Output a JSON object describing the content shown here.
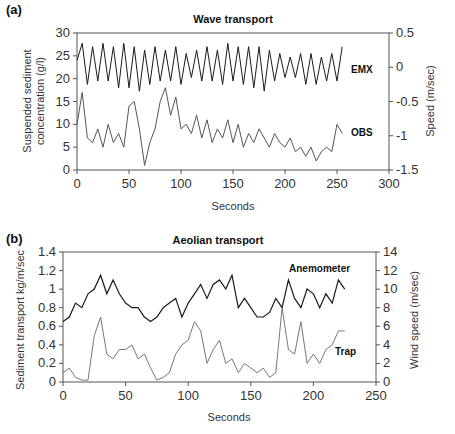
{
  "chart_data": [
    {
      "type": "line",
      "panel_label": "(a)",
      "title": "Wave transport",
      "xlabel": "Seconds",
      "ylabel": "Suspended sediment concentration (g/l)",
      "ylabel_lines": [
        "Suspended sediment",
        "concentration (g/l)"
      ],
      "y2label": "Speed (m/sec)",
      "xlim": [
        0,
        300
      ],
      "ylim": [
        0,
        30
      ],
      "y2lim": [
        -1.5,
        0.5
      ],
      "xticks": [
        0,
        50,
        100,
        150,
        200,
        250,
        300
      ],
      "yticks": [
        0,
        5,
        10,
        15,
        20,
        25,
        30
      ],
      "y2ticks": [
        "0.5",
        "0",
        "-0.5",
        "-1",
        "-1.5"
      ],
      "grid": false,
      "series": [
        {
          "name": "EMX",
          "axis": "right",
          "color": "#1a1a1a",
          "description": "Oscillating current speed roughly between -0.4 and 0.4 m/s, mean near 0",
          "x": [
            0,
            5,
            10,
            15,
            20,
            25,
            30,
            35,
            40,
            45,
            50,
            55,
            60,
            65,
            70,
            75,
            80,
            85,
            90,
            95,
            100,
            105,
            110,
            115,
            120,
            125,
            130,
            135,
            140,
            145,
            150,
            155,
            160,
            165,
            170,
            175,
            180,
            185,
            190,
            195,
            200,
            205,
            210,
            215,
            220,
            225,
            230,
            235,
            240,
            245,
            250,
            255
          ],
          "values": [
            0.1,
            0.35,
            -0.25,
            0.3,
            -0.2,
            0.35,
            -0.2,
            0.3,
            -0.3,
            0.35,
            -0.3,
            0.3,
            -0.35,
            0.25,
            -0.25,
            0.3,
            -0.2,
            0.25,
            -0.2,
            0.3,
            -0.25,
            0.2,
            -0.15,
            0.25,
            -0.2,
            0.3,
            -0.2,
            0.25,
            -0.25,
            0.35,
            -0.2,
            0.3,
            -0.25,
            0.3,
            -0.3,
            0.3,
            -0.35,
            0.25,
            -0.2,
            0.2,
            -0.15,
            0.15,
            -0.15,
            0.2,
            -0.25,
            0.2,
            -0.25,
            0.15,
            -0.2,
            0.2,
            -0.2,
            0.3
          ]
        },
        {
          "name": "OBS",
          "axis": "left",
          "color": "#555555",
          "description": "Suspended sediment concentration, mostly 3-10 g/l with bursts up to ~17-18 g/l near 50-110 s",
          "x": [
            0,
            5,
            10,
            15,
            20,
            25,
            30,
            35,
            40,
            45,
            50,
            55,
            60,
            65,
            70,
            75,
            80,
            85,
            90,
            95,
            100,
            105,
            110,
            115,
            120,
            125,
            130,
            135,
            140,
            145,
            150,
            155,
            160,
            165,
            170,
            175,
            180,
            185,
            190,
            195,
            200,
            205,
            210,
            215,
            220,
            225,
            230,
            235,
            240,
            245,
            250,
            255
          ],
          "values": [
            10,
            17,
            7,
            6,
            9,
            5,
            10,
            6,
            8,
            5,
            14,
            15,
            9,
            1,
            6,
            9,
            15,
            18,
            12,
            16,
            9,
            10,
            8,
            12,
            7,
            11,
            6,
            9,
            7,
            11,
            6,
            10,
            5,
            8,
            6,
            9,
            7,
            5,
            8,
            6,
            5,
            7,
            4,
            5,
            3,
            5,
            2,
            4,
            5,
            4,
            10,
            8
          ]
        }
      ],
      "annotations": [
        "EMX",
        "OBS"
      ]
    },
    {
      "type": "line",
      "panel_label": "(b)",
      "title": "Aeolian transport",
      "xlabel": "Seconds",
      "ylabel": "Sediment transport kg/m/sec",
      "y2label": "Wind speed (m/sec)",
      "xlim": [
        0,
        250
      ],
      "ylim": [
        0,
        1.4
      ],
      "y2lim": [
        0,
        14
      ],
      "xticks": [
        0,
        50,
        100,
        150,
        200,
        250
      ],
      "yticks": [
        "0",
        "0.2",
        "0.4",
        "0.6",
        "0.8",
        "1",
        "1.2",
        "1.4"
      ],
      "y2ticks": [
        0,
        2,
        4,
        6,
        8,
        10,
        12,
        14
      ],
      "grid": false,
      "series": [
        {
          "name": "Anemometer",
          "axis": "right",
          "color": "#1a1a1a",
          "description": "Wind speed fluctuating between ~6 and ~12 m/s",
          "x": [
            0,
            5,
            10,
            15,
            20,
            25,
            30,
            35,
            40,
            45,
            50,
            55,
            60,
            65,
            70,
            75,
            80,
            85,
            90,
            95,
            100,
            105,
            110,
            115,
            120,
            125,
            130,
            135,
            140,
            145,
            150,
            155,
            160,
            165,
            170,
            175,
            180,
            185,
            190,
            195,
            200,
            205,
            210,
            215,
            220,
            225
          ],
          "values": [
            6.5,
            7,
            8.5,
            8,
            9.5,
            10,
            11.5,
            9.5,
            11,
            9.5,
            8.5,
            8,
            8,
            7,
            6.5,
            7,
            8,
            8.5,
            9,
            7,
            8.5,
            9.5,
            10.5,
            9,
            10.5,
            11,
            10,
            11.5,
            8,
            9,
            8,
            7,
            7,
            7.5,
            9,
            8,
            11,
            9,
            8,
            10,
            9.5,
            8,
            9.5,
            8.5,
            11,
            10
          ]
        },
        {
          "name": "Trap",
          "axis": "left",
          "color": "#777777",
          "description": "Trap sediment transport with peaks ~0.7 at 30 s, ~0.65 at 107 s and ~0.8 at 173 s",
          "x": [
            0,
            5,
            10,
            15,
            20,
            25,
            30,
            35,
            40,
            45,
            50,
            55,
            60,
            65,
            70,
            75,
            80,
            85,
            90,
            95,
            100,
            105,
            110,
            115,
            120,
            125,
            130,
            135,
            140,
            145,
            150,
            155,
            160,
            165,
            170,
            175,
            180,
            185,
            190,
            195,
            200,
            205,
            210,
            215,
            220,
            225
          ],
          "values": [
            0.1,
            0.15,
            0.05,
            0.02,
            0.02,
            0.5,
            0.7,
            0.3,
            0.25,
            0.35,
            0.35,
            0.4,
            0.25,
            0.3,
            0.15,
            0.02,
            0.05,
            0.1,
            0.3,
            0.4,
            0.45,
            0.65,
            0.55,
            0.2,
            0.35,
            0.45,
            0.2,
            0.25,
            0.1,
            0.2,
            0.15,
            0.1,
            0.15,
            0.05,
            0.1,
            0.8,
            0.35,
            0.3,
            0.65,
            0.2,
            0.3,
            0.2,
            0.35,
            0.4,
            0.55,
            0.55
          ]
        }
      ],
      "annotations": [
        "Anemometer",
        "Trap"
      ]
    }
  ]
}
